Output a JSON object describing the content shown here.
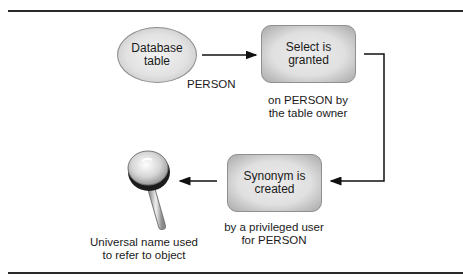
{
  "diagram": {
    "nodes": {
      "database_table": {
        "label_line1": "Database",
        "label_line2": "table",
        "sublabel": "PERSON"
      },
      "select_granted": {
        "label_line1": "Select is",
        "label_line2": "granted",
        "caption_line1": "on PERSON by",
        "caption_line2": "the table owner"
      },
      "synonym_created": {
        "label_line1": "Synonym is",
        "label_line2": "created",
        "caption_line1": "by a privileged user",
        "caption_line2": "for PERSON"
      },
      "universal_name": {
        "icon": "magnifying-glass-icon",
        "caption_line1": "Universal name used",
        "caption_line2": "to refer to object"
      }
    },
    "edges": [
      {
        "from": "database_table",
        "to": "select_granted"
      },
      {
        "from": "select_granted",
        "to": "synonym_created"
      },
      {
        "from": "synonym_created",
        "to": "universal_name"
      }
    ],
    "colors": {
      "rule": "#2a2a2a",
      "node_fill": "#e2e2e2",
      "node_border": "#8c8c8c",
      "arrow": "#111111"
    }
  }
}
